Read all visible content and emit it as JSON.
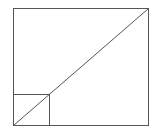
{
  "diagram": {
    "stroke_color": "#555555",
    "background": "#ffffff",
    "outer_rect": {
      "x": 13,
      "y": 8,
      "width": 135,
      "height": 117
    },
    "inner_square": {
      "x": 13,
      "y": 94,
      "width": 36,
      "height": 31
    },
    "diagonal": {
      "x1": 13,
      "y1": 125,
      "x2": 148,
      "y2": 8
    }
  }
}
